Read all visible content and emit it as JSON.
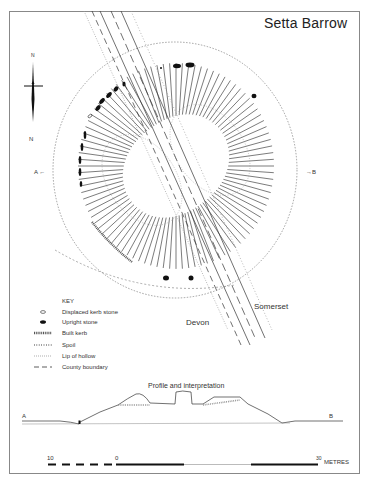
{
  "title": "Setta Barrow",
  "north_label": "N",
  "section_labels": {
    "a": "A",
    "b": "B",
    "a_arrow": "A ←",
    "b_arrow": "→B"
  },
  "counties": {
    "west": "Devon",
    "east": "Somerset"
  },
  "key": {
    "heading": "KEY",
    "items": [
      {
        "icon": "displaced-kerb-stone",
        "label": "Displaced kerb stone"
      },
      {
        "icon": "upright-stone",
        "label": "Upright stone"
      },
      {
        "icon": "built-kerb",
        "label": "Built kerb"
      },
      {
        "icon": "spoil",
        "label": "Spoil"
      },
      {
        "icon": "lip-of-hollow",
        "label": "Lip of hollow"
      },
      {
        "icon": "county-boundary",
        "label": "County boundary"
      }
    ]
  },
  "profile": {
    "title": "Profile and interpretation"
  },
  "scale": {
    "left": "10",
    "zero": "0",
    "right": "30",
    "unit": "METRES"
  },
  "colors": {
    "ink": "#222222",
    "frame": "#888888",
    "hatch": "#555555"
  }
}
